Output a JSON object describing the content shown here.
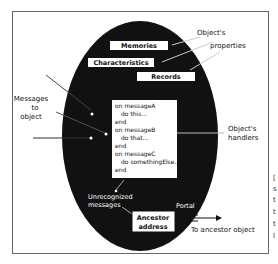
{
  "diagram": {
    "object_boxes": [
      {
        "label": "Memories"
      },
      {
        "label": "Characteristics"
      },
      {
        "label": "Records"
      }
    ],
    "properties_label": {
      "line1": "Object's",
      "line2": "properties"
    },
    "messages_label": {
      "line1": "Messages",
      "line2": "to",
      "line3": "object"
    },
    "handlers": {
      "lines": [
        "on messageA",
        "do this...",
        "end",
        "on messageB",
        "do that...",
        "end",
        "on messageC",
        "do somethingElse...",
        "end"
      ]
    },
    "handlers_label": {
      "line1": "Object's",
      "line2": "handlers"
    },
    "unrecognized_label": {
      "line1": "Unrecognized",
      "line2": "messages"
    },
    "ancestor_box": {
      "line1": "Ancestor",
      "line2": "address"
    },
    "portal_label": "Portal",
    "ancestor_object_label": "To ancestor object",
    "edge_text": [
      "[",
      "s",
      "t",
      "t",
      "t",
      "I"
    ],
    "colors": {
      "ellipse": "#111111",
      "box_fill": "#ffffff",
      "frame": "#555555"
    }
  }
}
